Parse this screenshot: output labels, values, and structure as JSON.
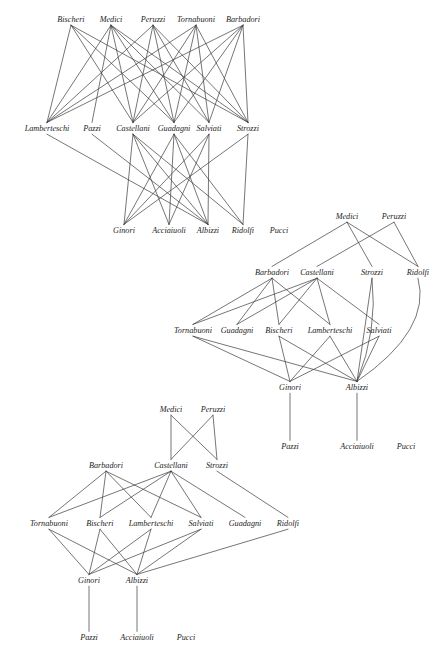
{
  "figure": {
    "title": "",
    "background_color": "#ffffff",
    "edge_color": "#3b3b3b",
    "label_color": "#1d1d1d",
    "width": 445,
    "height": 660,
    "drawings": [
      {
        "id": "drawing-1",
        "layers": [
          {
            "id": "d1-layer-1",
            "y": 22,
            "nodes": [
              {
                "id": "d1-bischeri",
                "label": "Bischeri",
                "x": 71
              },
              {
                "id": "d1-medici",
                "label": "Medici",
                "x": 111
              },
              {
                "id": "d1-peruzzi",
                "label": "Peruzzi",
                "x": 153
              },
              {
                "id": "d1-tornabuoni",
                "label": "Tornabuoni",
                "x": 196
              },
              {
                "id": "d1-barbadori",
                "label": "Barbadori",
                "x": 243
              }
            ]
          },
          {
            "id": "d1-layer-2",
            "y": 131,
            "nodes": [
              {
                "id": "d1-lamberteschi",
                "label": "Lamberteschi",
                "x": 47
              },
              {
                "id": "d1-pazzi",
                "label": "Pazzi",
                "x": 92
              },
              {
                "id": "d1-castellani",
                "label": "Castellani",
                "x": 133
              },
              {
                "id": "d1-guadagni",
                "label": "Guadagni",
                "x": 174
              },
              {
                "id": "d1-salviati",
                "label": "Salviati",
                "x": 209
              },
              {
                "id": "d1-strozzi",
                "label": "Strozzi",
                "x": 248
              }
            ]
          },
          {
            "id": "d1-layer-3",
            "y": 233,
            "nodes": [
              {
                "id": "d1-ginori",
                "label": "Ginori",
                "x": 124
              },
              {
                "id": "d1-acciaiuoli",
                "label": "Acciaiuoli",
                "x": 169
              },
              {
                "id": "d1-albizzi",
                "label": "Albizzi",
                "x": 208
              },
              {
                "id": "d1-ridolfi",
                "label": "Ridolfi",
                "x": 243
              },
              {
                "id": "d1-pucci",
                "label": "Pucci",
                "x": 279
              }
            ]
          }
        ],
        "edges": [
          [
            "d1-bischeri",
            "d1-lamberteschi"
          ],
          [
            "d1-bischeri",
            "d1-castellani"
          ],
          [
            "d1-bischeri",
            "d1-guadagni"
          ],
          [
            "d1-bischeri",
            "d1-strozzi"
          ],
          [
            "d1-medici",
            "d1-lamberteschi"
          ],
          [
            "d1-medici",
            "d1-pazzi"
          ],
          [
            "d1-medici",
            "d1-castellani"
          ],
          [
            "d1-medici",
            "d1-guadagni"
          ],
          [
            "d1-medici",
            "d1-salviati"
          ],
          [
            "d1-medici",
            "d1-strozzi"
          ],
          [
            "d1-peruzzi",
            "d1-lamberteschi"
          ],
          [
            "d1-peruzzi",
            "d1-castellani"
          ],
          [
            "d1-peruzzi",
            "d1-guadagni"
          ],
          [
            "d1-peruzzi",
            "d1-salviati"
          ],
          [
            "d1-peruzzi",
            "d1-strozzi"
          ],
          [
            "d1-tornabuoni",
            "d1-lamberteschi"
          ],
          [
            "d1-tornabuoni",
            "d1-castellani"
          ],
          [
            "d1-tornabuoni",
            "d1-guadagni"
          ],
          [
            "d1-tornabuoni",
            "d1-salviati"
          ],
          [
            "d1-tornabuoni",
            "d1-strozzi"
          ],
          [
            "d1-barbadori",
            "d1-lamberteschi"
          ],
          [
            "d1-barbadori",
            "d1-castellani"
          ],
          [
            "d1-barbadori",
            "d1-guadagni"
          ],
          [
            "d1-barbadori",
            "d1-salviati"
          ],
          [
            "d1-barbadori",
            "d1-strozzi"
          ],
          [
            "d1-lamberteschi",
            "d1-albizzi"
          ],
          [
            "d1-pazzi",
            "d1-albizzi"
          ],
          [
            "d1-castellani",
            "d1-ginori"
          ],
          [
            "d1-castellani",
            "d1-acciaiuoli"
          ],
          [
            "d1-castellani",
            "d1-albizzi"
          ],
          [
            "d1-castellani",
            "d1-ridolfi"
          ],
          [
            "d1-guadagni",
            "d1-ginori"
          ],
          [
            "d1-guadagni",
            "d1-acciaiuoli"
          ],
          [
            "d1-guadagni",
            "d1-albizzi"
          ],
          [
            "d1-guadagni",
            "d1-ridolfi"
          ],
          [
            "d1-salviati",
            "d1-ginori"
          ],
          [
            "d1-salviati",
            "d1-acciaiuoli"
          ],
          [
            "d1-salviati",
            "d1-albizzi"
          ],
          [
            "d1-strozzi",
            "d1-ginori"
          ],
          [
            "d1-strozzi",
            "d1-albizzi"
          ],
          [
            "d1-strozzi",
            "d1-ridolfi"
          ]
        ]
      },
      {
        "id": "drawing-2",
        "layers": [
          {
            "id": "d2-layer-1",
            "y": 219,
            "nodes": [
              {
                "id": "d2-medici",
                "label": "Medici",
                "x": 347
              },
              {
                "id": "d2-peruzzi",
                "label": "Peruzzi",
                "x": 394
              }
            ]
          },
          {
            "id": "d2-layer-2",
            "y": 275,
            "nodes": [
              {
                "id": "d2-barbadori",
                "label": "Barbadori",
                "x": 272
              },
              {
                "id": "d2-castellani",
                "label": "Castellani",
                "x": 317
              },
              {
                "id": "d2-strozzi",
                "label": "Strozzi",
                "x": 372
              },
              {
                "id": "d2-ridolfi",
                "label": "Ridolfi",
                "x": 418
              }
            ]
          },
          {
            "id": "d2-layer-3",
            "y": 333,
            "nodes": [
              {
                "id": "d2-tornabuoni",
                "label": "Tornabuoni",
                "x": 193
              },
              {
                "id": "d2-guadagni",
                "label": "Guadagni",
                "x": 237
              },
              {
                "id": "d2-bischeri",
                "label": "Bischeri",
                "x": 279
              },
              {
                "id": "d2-lamberteschi",
                "label": "Lamberteschi",
                "x": 330
              },
              {
                "id": "d2-salviati",
                "label": "Salviati",
                "x": 379
              }
            ]
          },
          {
            "id": "d2-layer-4",
            "y": 390,
            "nodes": [
              {
                "id": "d2-ginori",
                "label": "Ginori",
                "x": 290
              },
              {
                "id": "d2-albizzi",
                "label": "Albizzi",
                "x": 357
              }
            ]
          },
          {
            "id": "d2-layer-5",
            "y": 449,
            "nodes": [
              {
                "id": "d2-pazzi",
                "label": "Pazzi",
                "x": 290
              },
              {
                "id": "d2-acciaiuoli",
                "label": "Acciaiuoli",
                "x": 357
              },
              {
                "id": "d2-pucci",
                "label": "Pucci",
                "x": 406
              }
            ]
          }
        ],
        "edges": [
          [
            "d2-medici",
            "d2-barbadori"
          ],
          [
            "d2-medici",
            "d2-strozzi"
          ],
          [
            "d2-medici",
            "d2-ridolfi"
          ],
          [
            "d2-peruzzi",
            "d2-castellani"
          ],
          [
            "d2-peruzzi",
            "d2-ridolfi"
          ],
          [
            "d2-barbadori",
            "d2-tornabuoni"
          ],
          [
            "d2-barbadori",
            "d2-guadagni"
          ],
          [
            "d2-barbadori",
            "d2-bischeri"
          ],
          [
            "d2-barbadori",
            "d2-lamberteschi"
          ],
          [
            "d2-castellani",
            "d2-tornabuoni"
          ],
          [
            "d2-castellani",
            "d2-guadagni"
          ],
          [
            "d2-castellani",
            "d2-bischeri"
          ],
          [
            "d2-castellani",
            "d2-lamberteschi"
          ],
          [
            "d2-castellani",
            "d2-salviati"
          ],
          [
            "d2-strozzi",
            "d2-albizzi"
          ],
          [
            "d2-ridolfi",
            "d2-albizzi"
          ],
          [
            "d2-tornabuoni",
            "d2-ginori"
          ],
          [
            "d2-tornabuoni",
            "d2-albizzi"
          ],
          [
            "d2-bischeri",
            "d2-ginori"
          ],
          [
            "d2-bischeri",
            "d2-albizzi"
          ],
          [
            "d2-lamberteschi",
            "d2-ginori"
          ],
          [
            "d2-lamberteschi",
            "d2-albizzi"
          ],
          [
            "d2-salviati",
            "d2-ginori"
          ],
          [
            "d2-salviati",
            "d2-albizzi"
          ],
          [
            "d2-ginori",
            "d2-pazzi"
          ],
          [
            "d2-albizzi",
            "d2-acciaiuoli"
          ]
        ]
      },
      {
        "id": "drawing-3",
        "layers": [
          {
            "id": "d3-layer-1",
            "y": 412,
            "nodes": [
              {
                "id": "d3-medici",
                "label": "Medici",
                "x": 171
              },
              {
                "id": "d3-peruzzi",
                "label": "Peruzzi",
                "x": 213
              }
            ]
          },
          {
            "id": "d3-layer-2",
            "y": 468,
            "nodes": [
              {
                "id": "d3-barbadori",
                "label": "Barbadori",
                "x": 106
              },
              {
                "id": "d3-castellani",
                "label": "Castellani",
                "x": 171
              },
              {
                "id": "d3-strozzi",
                "label": "Strozzi",
                "x": 217
              }
            ]
          },
          {
            "id": "d3-layer-3",
            "y": 526,
            "nodes": [
              {
                "id": "d3-tornabuoni",
                "label": "Tornabuoni",
                "x": 49
              },
              {
                "id": "d3-bischeri",
                "label": "Bischeri",
                "x": 100
              },
              {
                "id": "d3-lamberteschi",
                "label": "Lamberteschi",
                "x": 151
              },
              {
                "id": "d3-salviati",
                "label": "Salviati",
                "x": 201
              },
              {
                "id": "d3-guadagni",
                "label": "Guadagni",
                "x": 245
              },
              {
                "id": "d3-ridolfi",
                "label": "Ridolfi",
                "x": 288
              }
            ]
          },
          {
            "id": "d3-layer-4",
            "y": 583,
            "nodes": [
              {
                "id": "d3-ginori",
                "label": "Ginori",
                "x": 89
              },
              {
                "id": "d3-albizzi",
                "label": "Albizzi",
                "x": 137
              }
            ]
          },
          {
            "id": "d3-layer-5",
            "y": 640,
            "nodes": [
              {
                "id": "d3-pazzi",
                "label": "Pazzi",
                "x": 89
              },
              {
                "id": "d3-acciaiuoli",
                "label": "Acciaiuoli",
                "x": 137
              },
              {
                "id": "d3-pucci",
                "label": "Pucci",
                "x": 186
              }
            ]
          }
        ],
        "edges": [
          [
            "d3-medici",
            "d3-castellani"
          ],
          [
            "d3-medici",
            "d3-strozzi"
          ],
          [
            "d3-peruzzi",
            "d3-castellani"
          ],
          [
            "d3-peruzzi",
            "d3-strozzi"
          ],
          [
            "d3-barbadori",
            "d3-tornabuoni"
          ],
          [
            "d3-barbadori",
            "d3-bischeri"
          ],
          [
            "d3-barbadori",
            "d3-lamberteschi"
          ],
          [
            "d3-barbadori",
            "d3-salviati"
          ],
          [
            "d3-castellani",
            "d3-tornabuoni"
          ],
          [
            "d3-castellani",
            "d3-bischeri"
          ],
          [
            "d3-castellani",
            "d3-lamberteschi"
          ],
          [
            "d3-castellani",
            "d3-salviati"
          ],
          [
            "d3-castellani",
            "d3-guadagni"
          ],
          [
            "d3-strozzi",
            "d3-ridolfi"
          ],
          [
            "d3-tornabuoni",
            "d3-ginori"
          ],
          [
            "d3-tornabuoni",
            "d3-albizzi"
          ],
          [
            "d3-bischeri",
            "d3-ginori"
          ],
          [
            "d3-bischeri",
            "d3-albizzi"
          ],
          [
            "d3-lamberteschi",
            "d3-ginori"
          ],
          [
            "d3-lamberteschi",
            "d3-albizzi"
          ],
          [
            "d3-salviati",
            "d3-ginori"
          ],
          [
            "d3-salviati",
            "d3-albizzi"
          ],
          [
            "d3-ridolfi",
            "d3-albizzi"
          ],
          [
            "d3-ginori",
            "d3-pazzi"
          ],
          [
            "d3-albizzi",
            "d3-acciaiuoli"
          ]
        ]
      }
    ],
    "isolated_notes": [
      {
        "id": "d2-pazzi-stub",
        "from": "d2-medici",
        "label": "Pazzi"
      }
    ]
  }
}
